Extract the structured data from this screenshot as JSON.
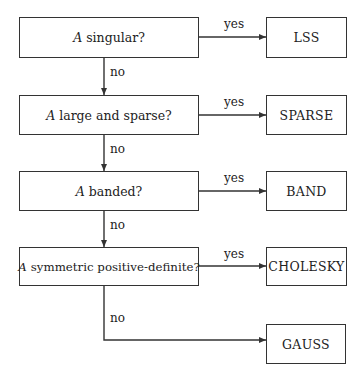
{
  "diagram": {
    "type": "flowchart",
    "decisions": [
      {
        "id": "q1",
        "variable": "A",
        "text": "singular?"
      },
      {
        "id": "q2",
        "variable": "A",
        "text": "large and sparse?"
      },
      {
        "id": "q3",
        "variable": "A",
        "text": "banded?"
      },
      {
        "id": "q4",
        "variable": "A",
        "text": "symmetric positive-definite?"
      }
    ],
    "outcomes": [
      {
        "id": "o1",
        "label": "LSS"
      },
      {
        "id": "o2",
        "label": "SPARSE"
      },
      {
        "id": "o3",
        "label": "BAND"
      },
      {
        "id": "o4",
        "label": "CHOLESKY"
      },
      {
        "id": "o5",
        "label": "GAUSS"
      }
    ],
    "edge_labels": {
      "yes": "yes",
      "no": "no"
    },
    "edges": [
      {
        "from": "q1",
        "to": "o1",
        "label": "yes"
      },
      {
        "from": "q1",
        "to": "q2",
        "label": "no"
      },
      {
        "from": "q2",
        "to": "o2",
        "label": "yes"
      },
      {
        "from": "q2",
        "to": "q3",
        "label": "no"
      },
      {
        "from": "q3",
        "to": "o3",
        "label": "yes"
      },
      {
        "from": "q3",
        "to": "q4",
        "label": "no"
      },
      {
        "from": "q4",
        "to": "o4",
        "label": "yes"
      },
      {
        "from": "q4",
        "to": "o5",
        "label": "no"
      }
    ],
    "colors": {
      "line": "#333333",
      "background": "#ffffff",
      "text": "#222222"
    }
  }
}
